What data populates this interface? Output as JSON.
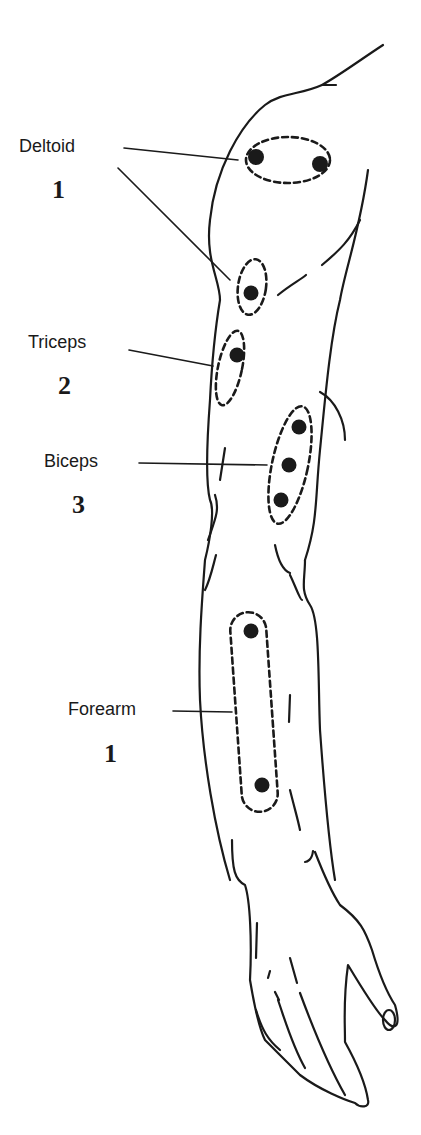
{
  "diagram": {
    "type": "anatomical-illustration",
    "sites": [
      {
        "muscle": "Deltoid",
        "count": "1",
        "points": 2
      },
      {
        "muscle": "Triceps",
        "count": "2",
        "points": 1
      },
      {
        "muscle": "Biceps",
        "count": "3",
        "points": 3
      },
      {
        "muscle": "Forearm",
        "count": "1",
        "points": 2
      }
    ]
  },
  "labels": {
    "deltoid": "Deltoid",
    "deltoid_num": "1",
    "triceps": "Triceps",
    "triceps_num": "2",
    "biceps": "Biceps",
    "biceps_num": "3",
    "forearm": "Forearm",
    "forearm_num": "1"
  },
  "colors": {
    "ink": "#1a1a1a",
    "background": "#ffffff"
  }
}
